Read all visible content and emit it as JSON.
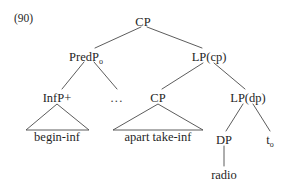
{
  "figure": {
    "example_number": "(90)",
    "background_color": "#ffffff",
    "line_color": "#4a4a4a",
    "text_color": "#1f1f1f",
    "type": "syntactic-tree-diagram"
  },
  "nodes": {
    "root": {
      "label": "CP",
      "x": 143,
      "y": 22
    },
    "predp": {
      "label": "PredP",
      "subscript": "o",
      "x": 88,
      "y": 57
    },
    "lp_cp": {
      "label": "LP(cp)",
      "x": 209,
      "y": 57
    },
    "infp": {
      "label": "InfP+",
      "x": 57,
      "y": 98
    },
    "ellipsis": {
      "label": "...",
      "x": 117,
      "y": 98
    },
    "cp_embedded": {
      "label": "CP",
      "x": 158,
      "y": 98
    },
    "lp_dp": {
      "label": "LP(dp)",
      "x": 248,
      "y": 98
    },
    "dp": {
      "label": "DP",
      "x": 224,
      "y": 140
    },
    "trace": {
      "label": "t",
      "subscript": "o",
      "x": 272,
      "y": 140
    }
  },
  "leaves": {
    "begin_inf": {
      "label": "begin-inf",
      "x": 57,
      "y": 140
    },
    "apart_take_inf": {
      "label": "apart take-inf",
      "x": 158,
      "y": 140
    },
    "radio": {
      "label": "radio",
      "x": 224,
      "y": 175
    }
  },
  "triangles": {
    "infp_triangle": {
      "apex_x": 57,
      "apex_y": 103,
      "left_x": 26,
      "right_x": 89,
      "base_y": 130
    },
    "cp_triangle": {
      "apex_x": 158,
      "apex_y": 103,
      "left_x": 113,
      "right_x": 203,
      "base_y": 130
    }
  },
  "branches": [
    {
      "name": "root-to-predp",
      "from": "CP",
      "to": "PredP"
    },
    {
      "name": "root-to-lp-cp",
      "from": "CP",
      "to": "LP(cp)"
    },
    {
      "name": "predp-to-infp",
      "from": "PredP",
      "to": "InfP+"
    },
    {
      "name": "predp-to-ellipsis",
      "from": "PredP",
      "to": "..."
    },
    {
      "name": "lp-cp-to-cp",
      "from": "LP(cp)",
      "to": "CP"
    },
    {
      "name": "lp-cp-to-lp-dp",
      "from": "LP(cp)",
      "to": "LP(dp)"
    },
    {
      "name": "lp-dp-to-dp",
      "from": "LP(dp)",
      "to": "DP"
    },
    {
      "name": "lp-dp-to-trace",
      "from": "LP(dp)",
      "to": "t"
    },
    {
      "name": "dp-to-radio",
      "from": "DP",
      "to": "radio"
    }
  ]
}
